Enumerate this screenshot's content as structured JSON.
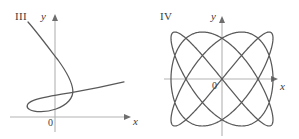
{
  "figure": {
    "background_color": "#ffffff",
    "curve_color": "#595959",
    "axis_color": "#b3b3b3",
    "text_color": "#3a3a3a"
  },
  "panels": [
    {
      "id": "III",
      "roman_label": "III",
      "y_axis_label": "y",
      "x_axis_label": "x",
      "origin_label": "0",
      "description": "parametric curve with a lower loop and an upper arc crossing itself"
    },
    {
      "id": "IV",
      "roman_label": "IV",
      "y_axis_label": "y",
      "x_axis_label": "x",
      "origin_label": "0",
      "description": "Lissajous figure filling a rounded rectangular region centered on the origin"
    }
  ],
  "chart_data": [
    {
      "type": "line",
      "title": "III",
      "xlabel": "x",
      "ylabel": "y",
      "grid": false,
      "legend": "none",
      "axes": {
        "origin_px": [
          55,
          117
        ],
        "x_axis_from_px": [
          10,
          117
        ],
        "x_axis_to_px": [
          131,
          117
        ],
        "y_axis_from_px": [
          55,
          132
        ],
        "y_axis_to_px": [
          55,
          15
        ]
      },
      "curves": [
        {
          "name": "looping-parametric-curve",
          "points_px": [
            [
              28,
              22
            ],
            [
              34,
              28
            ],
            [
              41,
              36
            ],
            [
              48,
              45
            ],
            [
              55,
              54
            ],
            [
              61,
              62
            ],
            [
              66,
              70
            ],
            [
              70,
              78
            ],
            [
              72,
              85
            ],
            [
              73,
              91
            ],
            [
              71,
              97
            ],
            [
              67,
              102
            ],
            [
              61,
              106
            ],
            [
              54,
              109
            ],
            [
              46,
              111
            ],
            [
              38,
              112
            ],
            [
              32,
              111
            ],
            [
              28,
              109
            ],
            [
              27,
              106
            ],
            [
              29,
              103
            ],
            [
              35,
              100
            ],
            [
              44,
              98
            ],
            [
              56,
              96
            ],
            [
              70,
              94
            ],
            [
              85,
              91
            ],
            [
              100,
              88
            ],
            [
              113,
              85
            ],
            [
              124,
              82
            ]
          ]
        }
      ]
    },
    {
      "type": "line",
      "title": "IV",
      "xlabel": "x",
      "ylabel": "y",
      "grid": false,
      "legend": "none",
      "axes": {
        "origin_px": [
          222,
          79
        ],
        "x_axis_from_px": [
          164,
          79
        ],
        "x_axis_to_px": [
          278,
          79
        ],
        "y_axis_from_px": [
          222,
          136
        ],
        "y_axis_to_px": [
          222,
          16
        ]
      },
      "curves": [
        {
          "name": "lissajous-figure",
          "parametric": {
            "x": "A*sin(a*t + d)",
            "y": "B*sin(b*t)",
            "A_px": 51,
            "B_px": 47,
            "a": 3,
            "b": 4,
            "delta": 0.0,
            "t_range": [
              0,
              6.283185307179586
            ],
            "samples": 900,
            "center_px": [
              222,
              79
            ]
          }
        }
      ]
    }
  ]
}
